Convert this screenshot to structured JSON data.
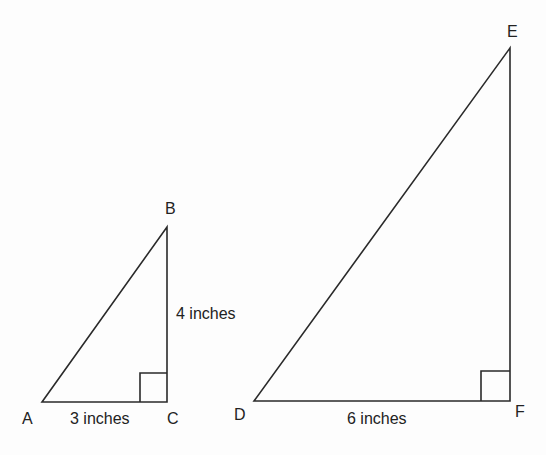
{
  "triangles": [
    {
      "name": "ABC",
      "vertices": {
        "A": "A",
        "B": "B",
        "C": "C"
      },
      "sides": {
        "AC": "3 inches",
        "BC": "4 inches"
      },
      "right_angle_at": "C"
    },
    {
      "name": "DEF",
      "vertices": {
        "D": "D",
        "E": "E",
        "F": "F"
      },
      "sides": {
        "DF": "6 inches"
      },
      "right_angle_at": "F"
    }
  ],
  "colors": {
    "stroke": "#2a2a2a",
    "background": "#fdfdfd"
  }
}
